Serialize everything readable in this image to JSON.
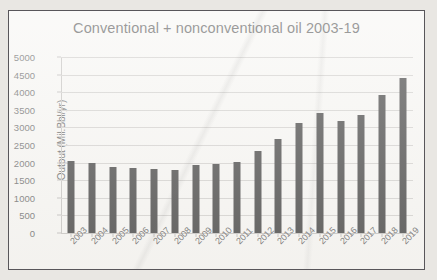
{
  "chart_data": {
    "type": "bar",
    "title": "Conventional + nonconventional oil 2003-19",
    "xlabel": "",
    "ylabel": "Output (Mil.Bbl/yr)",
    "ylim": [
      0,
      5000
    ],
    "y_ticks": [
      0,
      500,
      1000,
      1500,
      2000,
      2500,
      3000,
      3500,
      4000,
      4500,
      5000
    ],
    "y_tick_labels": [
      "0",
      "500",
      "1000",
      "1500",
      "2000",
      "2500",
      "3000",
      "3500",
      "4000",
      "4500",
      "5000"
    ],
    "grid": true,
    "legend": false,
    "bar_color": "#191919",
    "categories": [
      "2003",
      "2004",
      "2005",
      "2006",
      "2007",
      "2008",
      "2009",
      "2010",
      "2011",
      "2012",
      "2013",
      "2014",
      "2015",
      "2016",
      "2017",
      "2018",
      "2019"
    ],
    "values": [
      2060,
      1975,
      1880,
      1840,
      1820,
      1795,
      1920,
      1960,
      2020,
      2320,
      2670,
      3120,
      3400,
      3170,
      3350,
      3930,
      4400
    ]
  },
  "figure": {
    "background_color": "#f6f5f2",
    "border_color": "#58565a",
    "gridline_color": "#c9c7c4",
    "text_color": "#3b3b3b"
  }
}
